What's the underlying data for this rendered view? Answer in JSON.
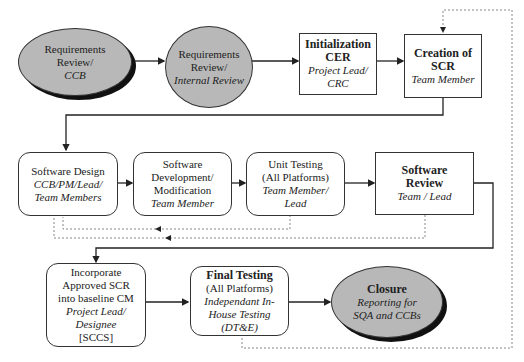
{
  "diagram": {
    "type": "process-flowchart",
    "nodes": [
      {
        "id": "req_ccb",
        "shape": "ellipse",
        "lines": [
          {
            "text": "Requirements",
            "style": "normal"
          },
          {
            "text": "Review/",
            "style": "normal"
          },
          {
            "text": "CCB",
            "style": "italic"
          }
        ]
      },
      {
        "id": "req_internal",
        "shape": "ellipse",
        "lines": [
          {
            "text": "Requirements",
            "style": "normal"
          },
          {
            "text": "Review/",
            "style": "normal"
          },
          {
            "text": "Internal Review",
            "style": "italic"
          }
        ]
      },
      {
        "id": "init_cer",
        "shape": "rectangle",
        "lines": [
          {
            "text": "Initialization",
            "style": "bold"
          },
          {
            "text": "CER",
            "style": "bold"
          },
          {
            "text": "Project Lead/",
            "style": "italic"
          },
          {
            "text": "CRC",
            "style": "italic"
          }
        ]
      },
      {
        "id": "create_scr",
        "shape": "rectangle",
        "lines": [
          {
            "text": "Creation of",
            "style": "bold"
          },
          {
            "text": "SCR",
            "style": "bold"
          },
          {
            "text": "Team Member",
            "style": "italic"
          }
        ]
      },
      {
        "id": "sw_design",
        "shape": "rounded-rectangle",
        "lines": [
          {
            "text": "Software Design",
            "style": "normal"
          },
          {
            "text": "CCB/PM/Lead/",
            "style": "italic"
          },
          {
            "text": "Team Members",
            "style": "italic"
          }
        ]
      },
      {
        "id": "sw_dev",
        "shape": "rounded-rectangle",
        "lines": [
          {
            "text": "Software",
            "style": "normal"
          },
          {
            "text": "Development/",
            "style": "normal"
          },
          {
            "text": "Modification",
            "style": "normal"
          },
          {
            "text": "Team Member",
            "style": "italic"
          }
        ]
      },
      {
        "id": "unit_test",
        "shape": "rounded-rectangle",
        "lines": [
          {
            "text": "Unit Testing",
            "style": "normal"
          },
          {
            "text": "(All Platforms)",
            "style": "normal"
          },
          {
            "text": "Team Member/",
            "style": "italic"
          },
          {
            "text": "Lead",
            "style": "italic"
          }
        ]
      },
      {
        "id": "sw_review",
        "shape": "rectangle",
        "lines": [
          {
            "text": "Software",
            "style": "bold"
          },
          {
            "text": "Review",
            "style": "bold"
          },
          {
            "text": "Team / Lead",
            "style": "italic"
          }
        ]
      },
      {
        "id": "incorporate",
        "shape": "rounded-rectangle",
        "lines": [
          {
            "text": "Incorporate",
            "style": "normal"
          },
          {
            "text": "Approved SCR",
            "style": "normal"
          },
          {
            "text": "into baseline CM",
            "style": "normal"
          },
          {
            "text": "Project Lead/",
            "style": "italic"
          },
          {
            "text": "Designee",
            "style": "italic"
          },
          {
            "text": "[SCCS]",
            "style": "normal"
          }
        ]
      },
      {
        "id": "final_test",
        "shape": "rounded-rectangle",
        "lines": [
          {
            "text": "Final Testing",
            "style": "bold"
          },
          {
            "text": "(All Platforms)",
            "style": "normal"
          },
          {
            "text": "Independant In-",
            "style": "italic"
          },
          {
            "text": "House Testing",
            "style": "italic"
          },
          {
            "text": "(DT&E)",
            "style": "italic"
          }
        ]
      },
      {
        "id": "closure",
        "shape": "ellipse",
        "lines": [
          {
            "text": "Closure",
            "style": "bold"
          },
          {
            "text": "Reporting for",
            "style": "italic"
          },
          {
            "text": "SQA and CCBs",
            "style": "italic"
          }
        ]
      }
    ],
    "edges": [
      {
        "from": "req_ccb",
        "to": "req_internal",
        "style": "solid"
      },
      {
        "from": "req_internal",
        "to": "init_cer",
        "style": "solid"
      },
      {
        "from": "init_cer",
        "to": "create_scr",
        "style": "solid"
      },
      {
        "from": "create_scr",
        "to": "sw_design",
        "style": "solid"
      },
      {
        "from": "sw_design",
        "to": "sw_dev",
        "style": "solid"
      },
      {
        "from": "sw_dev",
        "to": "unit_test",
        "style": "solid"
      },
      {
        "from": "unit_test",
        "to": "sw_review",
        "style": "solid"
      },
      {
        "from": "sw_review",
        "to": "incorporate",
        "style": "solid"
      },
      {
        "from": "incorporate",
        "to": "final_test",
        "style": "solid"
      },
      {
        "from": "final_test",
        "to": "closure",
        "style": "solid"
      },
      {
        "from": "unit_test",
        "to": "sw_design",
        "style": "dotted"
      },
      {
        "from": "sw_review",
        "to": "sw_design",
        "style": "dotted"
      },
      {
        "from": "final_test",
        "to": "create_scr",
        "style": "dotted"
      }
    ]
  }
}
